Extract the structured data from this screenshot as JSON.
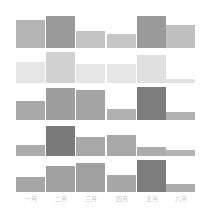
{
  "chart_data": [
    {
      "type": "bar",
      "title": "",
      "categories": [
        "一月",
        "二月",
        "三月",
        "四月",
        "五月",
        "六月"
      ],
      "series": [
        {
          "name": "row1",
          "values": [
            28,
            32,
            17,
            14,
            32,
            23
          ]
        }
      ],
      "colors": [
        "#b4b4b4",
        "#9a9a9a",
        "#c2c2c2",
        "#c6c6c6",
        "#9a9a9a",
        "#c0c0c0"
      ],
      "ylim": [
        0,
        36
      ],
      "grid": false
    },
    {
      "type": "bar",
      "title": "",
      "categories": [
        "一月",
        "二月",
        "三月",
        "四月",
        "五月",
        "六月"
      ],
      "series": [
        {
          "name": "row2",
          "values": [
            21,
            31,
            19,
            19,
            28,
            4
          ]
        }
      ],
      "colors": [
        "#e6e6e6",
        "#d2d2d2",
        "#e6e6e6",
        "#e6e6e6",
        "#e0e0e0",
        "#e2e2e2"
      ],
      "ylim": [
        0,
        36
      ],
      "grid": false
    },
    {
      "type": "bar",
      "title": "",
      "categories": [
        "一月",
        "二月",
        "三月",
        "四月",
        "五月",
        "六月"
      ],
      "series": [
        {
          "name": "row3",
          "values": [
            19,
            32,
            30,
            11,
            33,
            8
          ]
        }
      ],
      "colors": [
        "#a9a9a9",
        "#9e9e9e",
        "#a4a4a4",
        "#b0b0b0",
        "#7c7c7c",
        "#b2b2b2"
      ],
      "ylim": [
        0,
        36
      ],
      "grid": false
    },
    {
      "type": "bar",
      "title": "",
      "categories": [
        "一月",
        "二月",
        "三月",
        "四月",
        "五月",
        "六月"
      ],
      "series": [
        {
          "name": "row4",
          "values": [
            11,
            30,
            19,
            21,
            9,
            6
          ]
        }
      ],
      "colors": [
        "#acacac",
        "#7a7a7a",
        "#a8a8a8",
        "#a8a8a8",
        "#acacac",
        "#b4b4b4"
      ],
      "ylim": [
        0,
        36
      ],
      "grid": false
    },
    {
      "type": "bar",
      "title": "",
      "categories": [
        "一月",
        "二月",
        "三月",
        "四月",
        "五月",
        "六月"
      ],
      "series": [
        {
          "name": "row5",
          "values": [
            15,
            26,
            29,
            17,
            32,
            8
          ]
        }
      ],
      "colors": [
        "#a6a6a6",
        "#a0a0a0",
        "#a0a0a0",
        "#a6a6a6",
        "#7c7c7c",
        "#acacac"
      ],
      "xlabel": "",
      "ylabel": "",
      "ylim": [
        0,
        36
      ],
      "grid": false
    }
  ],
  "rows": [
    {
      "baseline": 48,
      "tops": [
        20,
        16,
        31,
        34,
        16,
        25
      ]
    },
    {
      "baseline": 83,
      "tops": [
        62,
        52,
        64,
        64,
        55,
        79
      ]
    },
    {
      "baseline": 120,
      "tops": [
        101,
        88,
        90,
        109,
        87,
        112
      ]
    },
    {
      "baseline": 156,
      "tops": [
        145,
        126,
        137,
        135,
        147,
        150
      ]
    },
    {
      "baseline": 192,
      "tops": [
        177,
        166,
        163,
        175,
        160,
        184
      ]
    }
  ],
  "x_labels": [
    "一月",
    "二月",
    "三月",
    "四月",
    "五月",
    "六月"
  ]
}
